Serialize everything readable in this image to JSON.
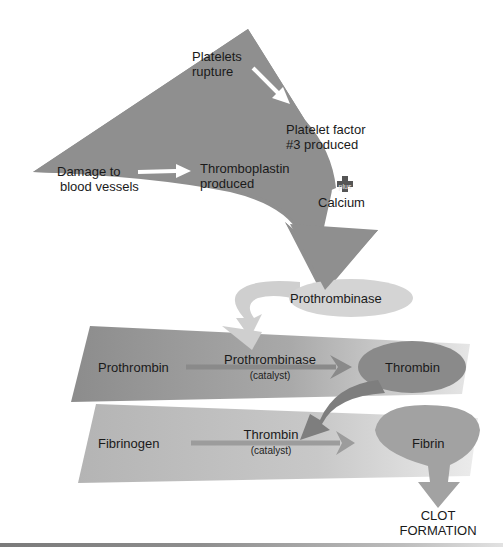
{
  "diagram": {
    "colors": {
      "dark_gray": "#8a8a8a",
      "mid_gray": "#9a9a9a",
      "light_gray": "#c4c4c4",
      "pale_gray": "#d6d6d6",
      "white_arrow": "#ffffff",
      "text": "#1a1a1a"
    },
    "stage1": {
      "platelets_rupture": [
        "Platelets",
        "rupture"
      ],
      "platelet_factor": [
        "Platelet factor",
        "#3 produced"
      ],
      "damage": [
        "Damage to",
        "blood vessels"
      ],
      "thromboplastin": [
        "Thromboplastin",
        "produced"
      ],
      "plus_label": "plus",
      "calcium": "Calcium"
    },
    "stage2": {
      "prothrombinase": "Prothrombinase"
    },
    "stage3": {
      "substrate": "Prothrombin",
      "catalyst_name": "Prothrombinase",
      "catalyst_note": "(catalyst)",
      "product": "Thrombin"
    },
    "stage4": {
      "substrate": "Fibrinogen",
      "catalyst_name": "Thrombin",
      "catalyst_note": "(catalyst)",
      "product": "Fibrin"
    },
    "result": [
      "CLOT",
      "FORMATION"
    ]
  }
}
